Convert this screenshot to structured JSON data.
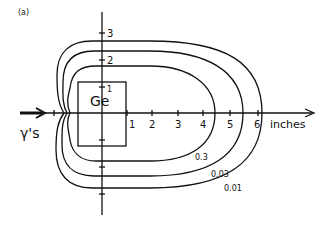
{
  "figure": {
    "panel_label": "(a)",
    "beam_label": "γ's",
    "detector_label": "Ge",
    "x_unit_label": "inches",
    "x_ticks": [
      "1",
      "2",
      "3",
      "4",
      "5",
      "6"
    ],
    "y_ticks_up": [
      "1",
      "2",
      "3"
    ],
    "contours": [
      {
        "label": "0.3"
      },
      {
        "label": "0.03"
      },
      {
        "label": "0.01"
      }
    ],
    "line_color": "#111111"
  }
}
